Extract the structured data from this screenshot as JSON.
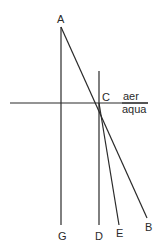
{
  "diagram": {
    "type": "refraction-geometry",
    "points": {
      "A": {
        "label": "A",
        "x": 61,
        "y": 27
      },
      "C": {
        "label": "C",
        "x": 99,
        "y": 103
      },
      "B": {
        "label": "B",
        "x": 147,
        "y": 218
      },
      "E": {
        "label": "E",
        "x": 119,
        "y": 225
      },
      "D": {
        "label": "D",
        "x": 99,
        "y": 225
      },
      "G": {
        "label": "G",
        "x": 61,
        "y": 225
      }
    },
    "media": {
      "upper": "aer",
      "lower": "aqua"
    },
    "lines": [
      {
        "name": "AG",
        "from": "A",
        "to": "G"
      },
      {
        "name": "AB",
        "from": "A",
        "to": "B"
      },
      {
        "name": "CD",
        "from": "C-normal-top",
        "to": "D"
      },
      {
        "name": "CE",
        "from": "C",
        "to": "E"
      },
      {
        "name": "surface",
        "from": "left",
        "to": "right"
      }
    ],
    "color": "#2a2a2a"
  }
}
